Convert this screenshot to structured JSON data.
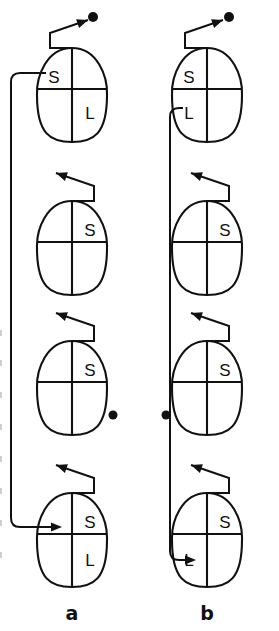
{
  "figure": {
    "width": 279,
    "height": 631,
    "background": "#ffffff",
    "ink_color": "#111111",
    "panel_labels": [
      {
        "name": "panel-a",
        "text": "a",
        "x": 72,
        "y": 620
      },
      {
        "name": "panel-b",
        "text": "b",
        "x": 207,
        "y": 620
      }
    ]
  },
  "columns": [
    {
      "id": "a",
      "label": "a",
      "center_x": 72,
      "stages": [
        {
          "index": 1,
          "name": "stage-a1",
          "cx": 72,
          "cy": 95,
          "labels": [
            {
              "text": "S",
              "quadrant": "upper-left",
              "x": 54,
              "y": 79
            },
            {
              "text": "L",
              "quadrant": "lower-right",
              "x": 90,
              "y": 115
            }
          ],
          "pointer": {
            "direction": "right",
            "apex_x": 72,
            "apex_y": 48,
            "elbow_x": 50,
            "elbow_y": 33,
            "tip_x": 88,
            "tip_y": 20
          },
          "dot": {
            "x": 93,
            "y": 17,
            "r": 5
          }
        },
        {
          "index": 2,
          "name": "stage-a2",
          "cx": 72,
          "cy": 248,
          "labels": [
            {
              "text": "S",
              "quadrant": "upper-right",
              "x": 90,
              "y": 232
            }
          ],
          "pointer": {
            "direction": "left",
            "apex_x": 72,
            "apex_y": 201,
            "elbow_x": 94,
            "elbow_y": 186,
            "tip_x": 56,
            "tip_y": 173
          },
          "dot": null
        },
        {
          "index": 3,
          "name": "stage-a3",
          "cx": 72,
          "cy": 388,
          "labels": [
            {
              "text": "S",
              "quadrant": "upper-right",
              "x": 90,
              "y": 372
            }
          ],
          "pointer": {
            "direction": "left",
            "apex_x": 72,
            "apex_y": 341,
            "elbow_x": 94,
            "elbow_y": 326,
            "tip_x": 56,
            "tip_y": 313
          },
          "dot": {
            "x": 113,
            "y": 415,
            "r": 4.5
          }
        },
        {
          "index": 4,
          "name": "stage-a4",
          "cx": 72,
          "cy": 540,
          "labels": [
            {
              "text": "S",
              "quadrant": "upper-right",
              "x": 90,
              "y": 524
            },
            {
              "text": "L",
              "quadrant": "lower-right",
              "x": 90,
              "y": 562
            }
          ],
          "pointer": {
            "direction": "left",
            "apex_x": 72,
            "apex_y": 493,
            "elbow_x": 94,
            "elbow_y": 478,
            "tip_x": 56,
            "tip_y": 465
          },
          "dot": null
        }
      ],
      "connector": {
        "name": "connector-a",
        "from_stage": 1,
        "to_stage": 4,
        "start_x": 46,
        "start_y": 73,
        "rail_x": 11,
        "end_y": 527,
        "end_x": 62,
        "arrow_direction": "right"
      }
    },
    {
      "id": "b",
      "label": "b",
      "center_x": 207,
      "stages": [
        {
          "index": 1,
          "name": "stage-b1",
          "cx": 207,
          "cy": 95,
          "labels": [
            {
              "text": "S",
              "quadrant": "upper-left",
              "x": 189,
              "y": 79
            },
            {
              "text": "L",
              "quadrant": "lower-left",
              "x": 189,
              "y": 115
            }
          ],
          "pointer": {
            "direction": "right",
            "apex_x": 207,
            "apex_y": 48,
            "elbow_x": 185,
            "elbow_y": 33,
            "tip_x": 223,
            "tip_y": 20
          },
          "dot": {
            "x": 229,
            "y": 17,
            "r": 5
          }
        },
        {
          "index": 2,
          "name": "stage-b2",
          "cx": 207,
          "cy": 248,
          "labels": [
            {
              "text": "S",
              "quadrant": "upper-right",
              "x": 225,
              "y": 232
            }
          ],
          "pointer": {
            "direction": "left",
            "apex_x": 207,
            "apex_y": 201,
            "elbow_x": 229,
            "elbow_y": 186,
            "tip_x": 191,
            "tip_y": 173
          },
          "dot": null
        },
        {
          "index": 3,
          "name": "stage-b3",
          "cx": 207,
          "cy": 388,
          "labels": [
            {
              "text": "S",
              "quadrant": "upper-right",
              "x": 225,
              "y": 372
            }
          ],
          "pointer": {
            "direction": "left",
            "apex_x": 207,
            "apex_y": 341,
            "elbow_x": 229,
            "elbow_y": 326,
            "tip_x": 191,
            "tip_y": 313
          },
          "dot": {
            "x": 166,
            "y": 415,
            "r": 4.5
          }
        },
        {
          "index": 4,
          "name": "stage-b4",
          "cx": 207,
          "cy": 540,
          "labels": [
            {
              "text": "S",
              "quadrant": "upper-right",
              "x": 225,
              "y": 524
            },
            {
              "text": "L",
              "quadrant": "lower-left",
              "x": 189,
              "y": 562
            }
          ],
          "pointer": {
            "direction": "left",
            "apex_x": 207,
            "apex_y": 493,
            "elbow_x": 229,
            "elbow_y": 478,
            "tip_x": 191,
            "tip_y": 465
          },
          "dot": null
        }
      ],
      "connector": {
        "name": "connector-b",
        "from_stage": 1,
        "to_stage": 4,
        "start_x": 183,
        "start_y": 108,
        "rail_x": 170,
        "end_y": 560,
        "end_x": 196,
        "arrow_direction": "right"
      }
    }
  ],
  "geometry": {
    "egg_half_width": 35,
    "egg_half_height": 47,
    "egg_top_narrow_factor": 0.8,
    "horizontal_divider_offset": -6
  }
}
